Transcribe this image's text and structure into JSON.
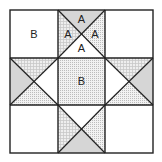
{
  "diagram": {
    "type": "quilt-block",
    "pattern_name": "Ohio Star",
    "grid": "3x3",
    "labels": {
      "corner_top_left": "B",
      "center": "B",
      "top_unit_top": "A",
      "top_unit_left": "A",
      "top_unit_right": "A",
      "top_unit_bottom": "A"
    },
    "colors": {
      "outline": "#222222",
      "solid_gray": "#d6d6d6",
      "check_bg": "#eeeeee",
      "check_line": "#c8c8c8",
      "dot_bg": "#f2f2f2",
      "dot": "#bdbdbd",
      "white": "#ffffff"
    }
  }
}
